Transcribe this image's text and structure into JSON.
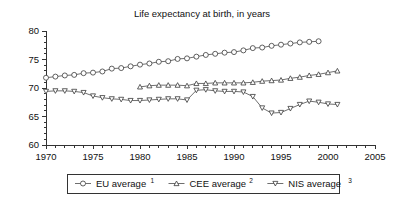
{
  "chart_data": {
    "type": "line",
    "title": "Life expectancy at birth, in years",
    "xlabel": "",
    "ylabel": "",
    "xlim": [
      1970,
      2005
    ],
    "ylim": [
      60,
      80
    ],
    "x_major_ticks": [
      1970,
      1975,
      1980,
      1985,
      1990,
      1995,
      2000,
      2005
    ],
    "x_tick_labels": [
      "1970",
      "1975",
      "1980",
      "1985",
      "1990",
      "1995",
      "2000",
      "2005"
    ],
    "x_minor_step": 1,
    "y_ticks": [
      60,
      65,
      70,
      75,
      80
    ],
    "y_tick_labels": [
      "60",
      "65",
      "70",
      "75",
      "80"
    ],
    "y_minor_step": 1,
    "grid": false,
    "legend_position": "bottom",
    "series": [
      {
        "name": "EU average",
        "superscript": "1",
        "marker": "circle",
        "x": [
          1970,
          1971,
          1972,
          1973,
          1974,
          1975,
          1976,
          1977,
          1978,
          1979,
          1980,
          1981,
          1982,
          1983,
          1984,
          1985,
          1986,
          1987,
          1988,
          1989,
          1990,
          1991,
          1992,
          1993,
          1994,
          1995,
          1996,
          1997,
          1998,
          1999
        ],
        "values": [
          71.8,
          72.0,
          72.2,
          72.3,
          72.6,
          72.7,
          72.9,
          73.4,
          73.5,
          73.8,
          74.1,
          74.3,
          74.6,
          74.7,
          75.1,
          75.2,
          75.5,
          75.8,
          76.0,
          76.2,
          76.3,
          76.6,
          77.0,
          77.1,
          77.4,
          77.6,
          77.8,
          78.0,
          78.1,
          78.2
        ]
      },
      {
        "name": "CEE average",
        "superscript": "2",
        "marker": "triangle-up",
        "x": [
          1980,
          1981,
          1982,
          1983,
          1984,
          1985,
          1986,
          1987,
          1988,
          1989,
          1990,
          1991,
          1992,
          1993,
          1994,
          1995,
          1996,
          1997,
          1998,
          1999,
          2000,
          2001
        ],
        "values": [
          70.2,
          70.4,
          70.5,
          70.5,
          70.5,
          70.4,
          70.8,
          70.8,
          70.9,
          70.9,
          70.9,
          70.9,
          71.0,
          71.2,
          71.3,
          71.4,
          71.7,
          71.9,
          72.2,
          72.4,
          72.7,
          73.0
        ]
      },
      {
        "name": "NIS average",
        "superscript": "3",
        "marker": "triangle-down",
        "x": [
          1970,
          1971,
          1972,
          1973,
          1974,
          1975,
          1976,
          1977,
          1978,
          1979,
          1980,
          1981,
          1982,
          1983,
          1984,
          1985,
          1986,
          1987,
          1988,
          1989,
          1990,
          1991,
          1992,
          1993,
          1994,
          1995,
          1996,
          1997,
          1998,
          1999,
          2000,
          2001
        ],
        "values": [
          69.4,
          69.5,
          69.5,
          69.4,
          69.2,
          68.6,
          68.3,
          68.1,
          68.0,
          67.8,
          67.8,
          67.9,
          68.0,
          68.1,
          68.1,
          67.9,
          69.6,
          69.7,
          69.5,
          69.4,
          69.4,
          69.3,
          68.5,
          66.5,
          65.6,
          65.7,
          66.4,
          67.1,
          67.7,
          67.5,
          67.2,
          67.1
        ]
      }
    ]
  },
  "legend": {
    "items": [
      {
        "label": "EU average",
        "superscript": "1",
        "marker": "circle"
      },
      {
        "label": "CEE average",
        "superscript": "2",
        "marker": "triangle-up"
      },
      {
        "label": "NIS average",
        "superscript": "3",
        "marker": "triangle-down"
      }
    ]
  },
  "colors": {
    "axis": "#333333",
    "line": "#4a4a4a",
    "marker_fill": "#ffffff",
    "marker_stroke": "#3a3a3a",
    "text": "#111111",
    "background": "#ffffff"
  }
}
